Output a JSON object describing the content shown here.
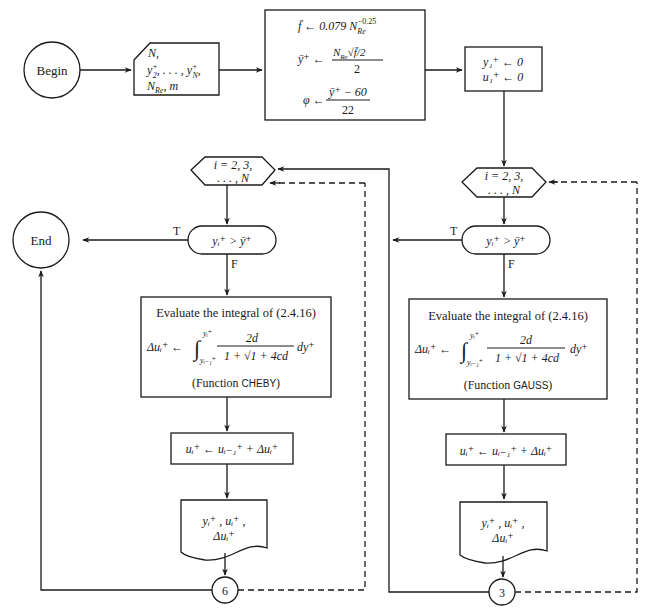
{
  "header": {
    "fragment": ""
  },
  "nodes": {
    "begin": {
      "label": "Begin",
      "type": "terminal"
    },
    "input": {
      "type": "manual-input",
      "line1": "N,",
      "line2_a": "y",
      "line2_sup": "+",
      "line2_sub": "2",
      "line2_mid": ", . . . , y",
      "line2_sup2": "+",
      "line2_sub2": "N",
      "line2_end": ",",
      "line3": "N",
      "line3_sub": "Re",
      "line3_end": ", m"
    },
    "init_calc": {
      "type": "process",
      "line1_lhs": "f̄ ← 0.079 N",
      "line1_sub": "Re",
      "line1_sup": "−0.25",
      "line2_lhs": "ȳ⁺ ←",
      "line2_num": "N",
      "line2_num_sub": "Re",
      "line2_num_rest": "√f̄/2",
      "line2_den": "2",
      "line3_lhs": "φ ←",
      "line3_num": "ȳ⁺ − 60",
      "line3_den": "22"
    },
    "init_zero": {
      "type": "process",
      "line1": "y₁⁺ ← 0",
      "line2": "u₁⁺ ← 0"
    },
    "left_branch": {
      "loop": {
        "type": "preparation",
        "line1": "i = 2, 3,",
        "line2": ". . . , N"
      },
      "decision": {
        "type": "decision",
        "label": "yᵢ⁺ > ȳ⁺",
        "true_label": "T",
        "false_label": "F"
      },
      "integral": {
        "type": "process",
        "title": "Evaluate the integral of (2.4.16)",
        "lhs": "Δuᵢ⁺ ←",
        "upper": "yᵢ⁺",
        "lower": "yᵢ₋₁⁺",
        "numerator": "2d",
        "denominator": "1 + √1 + 4cd",
        "dvar": "dy⁺",
        "func_prefix": "(Function ",
        "func_name": "CHEBY",
        "func_suffix": ")"
      },
      "update": {
        "type": "process",
        "label": "uᵢ⁺ ← uᵢ₋₁⁺ + Δuᵢ⁺"
      },
      "output": {
        "type": "document",
        "line1": "yᵢ⁺ , uᵢ⁺ ,",
        "line2": "Δuᵢ⁺"
      },
      "connector": {
        "type": "connector",
        "label": "6"
      }
    },
    "right_branch": {
      "loop": {
        "type": "preparation",
        "line1": "i = 2, 3,",
        "line2": ". . . , N"
      },
      "decision": {
        "type": "decision",
        "label": "yᵢ⁺ > ȳ⁺",
        "true_label": "T",
        "false_label": "F"
      },
      "integral": {
        "type": "process",
        "title": "Evaluate the integral of (2.4.16)",
        "lhs": "Δuᵢ⁺ ←",
        "upper": "yᵢ⁺",
        "lower": "yᵢ₋₁⁺",
        "numerator": "2d",
        "denominator": "1 + √1 + 4cd",
        "dvar": "dy⁺",
        "func_prefix": "(Function ",
        "func_name": "GAUSS",
        "func_suffix": ")"
      },
      "update": {
        "type": "process",
        "label": "uᵢ⁺ ← uᵢ₋₁⁺ + Δuᵢ⁺"
      },
      "output": {
        "type": "document",
        "line1": "yᵢ⁺ , uᵢ⁺ ,",
        "line2": "Δuᵢ⁺"
      },
      "connector": {
        "type": "connector",
        "label": "3"
      }
    },
    "end": {
      "label": "End",
      "type": "terminal"
    }
  },
  "colors": {
    "stroke": "#1a1a1a",
    "background": "#ffffff"
  }
}
